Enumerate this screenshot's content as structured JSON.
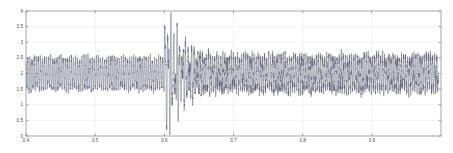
{
  "chart_data": {
    "type": "line",
    "title": "",
    "subtitle": "",
    "xlabel": "",
    "ylabel": "",
    "xlim": [
      0.4,
      1.0
    ],
    "ylim": [
      0,
      4
    ],
    "grid": true,
    "legend": null,
    "legend_position": "none",
    "line_color": "#5a5a6e",
    "axis_color": "#808080",
    "grid_color": "#e8e8e8",
    "x_ticks": [
      0.4,
      0.5,
      0.6,
      0.7,
      0.8,
      0.9
    ],
    "x_tick_labels": [
      "0.4",
      "0.5",
      "0.6",
      "0.7",
      "0.8",
      "0.9"
    ],
    "y_ticks": [
      0,
      0.5,
      1,
      1.5,
      2,
      2.5,
      3,
      3.5,
      4
    ],
    "y_tick_labels": [
      "0",
      "0.5",
      "1",
      "1.5",
      "2",
      "2.5",
      "3",
      "3.5",
      "4"
    ],
    "series": [
      {
        "name": "signal",
        "carrier_mean": 2.0,
        "carrier_amplitude_pre": 0.48,
        "carrier_amplitude_post": 0.52,
        "oscillation_period": 0.003,
        "transient_start": 0.6,
        "transient_peak_value": 3.72,
        "transient_min_value": 0.55,
        "transient_decay_end": 0.69,
        "noise_level": 0.09
      }
    ]
  }
}
